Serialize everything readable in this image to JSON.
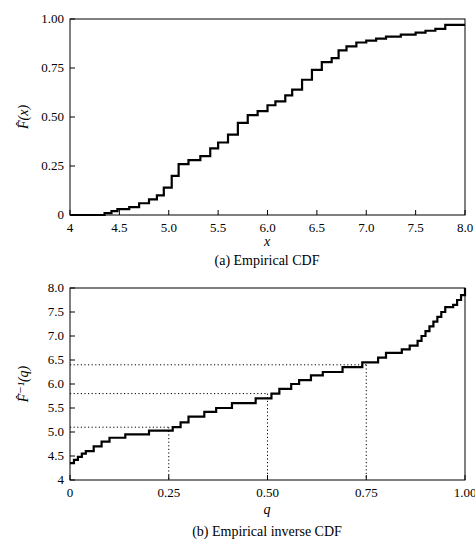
{
  "chart_data": [
    {
      "type": "line",
      "subtype": "step",
      "title": "",
      "caption": "(a) Empirical CDF",
      "xlabel": "x",
      "ylabel": "F̂(x)",
      "xlim": [
        4,
        8
      ],
      "ylim": [
        0,
        1
      ],
      "xticks": [
        "4",
        "4.5",
        "5.0",
        "5.5",
        "6.0",
        "6.5",
        "7.0",
        "7.5",
        "8.0"
      ],
      "yticks": [
        "0",
        "0.25",
        "0.50",
        "0.75",
        "1.00"
      ],
      "grid": false,
      "x": [
        4.0,
        4.35,
        4.42,
        4.48,
        4.6,
        4.7,
        4.8,
        4.88,
        4.95,
        5.03,
        5.1,
        5.2,
        5.32,
        5.42,
        5.5,
        5.6,
        5.7,
        5.8,
        5.9,
        6.0,
        6.08,
        6.18,
        6.25,
        6.35,
        6.45,
        6.55,
        6.65,
        6.72,
        6.8,
        6.9,
        7.0,
        7.1,
        7.2,
        7.35,
        7.5,
        7.6,
        7.7,
        7.8,
        8.0
      ],
      "values": [
        0,
        0.01,
        0.02,
        0.03,
        0.04,
        0.06,
        0.08,
        0.1,
        0.14,
        0.2,
        0.26,
        0.28,
        0.3,
        0.34,
        0.37,
        0.41,
        0.47,
        0.51,
        0.53,
        0.56,
        0.58,
        0.61,
        0.64,
        0.69,
        0.74,
        0.78,
        0.8,
        0.84,
        0.86,
        0.88,
        0.89,
        0.9,
        0.91,
        0.92,
        0.93,
        0.94,
        0.95,
        0.97,
        0.97
      ]
    },
    {
      "type": "line",
      "subtype": "step",
      "title": "",
      "caption": "(b) Empirical inverse CDF",
      "xlabel": "q",
      "ylabel": "F̂⁻¹(q)",
      "xlim": [
        0,
        1
      ],
      "ylim": [
        4,
        8
      ],
      "xticks": [
        "0",
        "0.25",
        "0.50",
        "0.75",
        "1.00"
      ],
      "yticks": [
        "4",
        "4.5",
        "5.0",
        "5.5",
        "6.0",
        "6.5",
        "7.0",
        "7.5",
        "8.0"
      ],
      "grid": false,
      "annotations": [
        {
          "q": 0.25,
          "value": 5.1,
          "style": "dotted"
        },
        {
          "q": 0.5,
          "value": 5.8,
          "style": "dotted"
        },
        {
          "q": 0.75,
          "value": 6.4,
          "style": "dotted"
        }
      ],
      "x": [
        0,
        0.01,
        0.02,
        0.03,
        0.04,
        0.06,
        0.08,
        0.1,
        0.14,
        0.2,
        0.26,
        0.28,
        0.3,
        0.34,
        0.37,
        0.41,
        0.47,
        0.51,
        0.53,
        0.56,
        0.58,
        0.61,
        0.64,
        0.69,
        0.74,
        0.78,
        0.8,
        0.84,
        0.86,
        0.88,
        0.89,
        0.9,
        0.91,
        0.92,
        0.93,
        0.94,
        0.95,
        0.97,
        0.98,
        0.99,
        1.0
      ],
      "values": [
        4.35,
        4.42,
        4.48,
        4.55,
        4.6,
        4.7,
        4.8,
        4.88,
        4.95,
        5.03,
        5.1,
        5.2,
        5.32,
        5.42,
        5.5,
        5.6,
        5.7,
        5.8,
        5.9,
        6.0,
        6.08,
        6.18,
        6.25,
        6.35,
        6.45,
        6.55,
        6.65,
        6.72,
        6.8,
        6.9,
        7.0,
        7.1,
        7.2,
        7.3,
        7.4,
        7.5,
        7.6,
        7.65,
        7.75,
        7.85,
        8.0
      ]
    }
  ]
}
